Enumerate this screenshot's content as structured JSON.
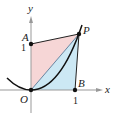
{
  "diagram": {
    "axes": {
      "x_label": "x",
      "y_label": "y",
      "x_tick": "1",
      "y_tick": "1"
    },
    "points": {
      "O": {
        "label": "O",
        "coords": [
          0,
          0
        ]
      },
      "A": {
        "label": "A",
        "coords": [
          0,
          1
        ]
      },
      "B": {
        "label": "B",
        "coords": [
          1,
          0
        ]
      },
      "P": {
        "label": "P",
        "coords": [
          1,
          1
        ]
      }
    },
    "curve": "parabola through O and P",
    "regions": [
      {
        "name": "triangle-OAP",
        "color": "#f6d6d6"
      },
      {
        "name": "region-OBP-under-segment",
        "color": "#cce8f4"
      }
    ],
    "colors": {
      "pink_region": "#f6d6d6",
      "blue_region": "#cce8f4",
      "lines": "#222222",
      "axes": "#999999"
    }
  }
}
